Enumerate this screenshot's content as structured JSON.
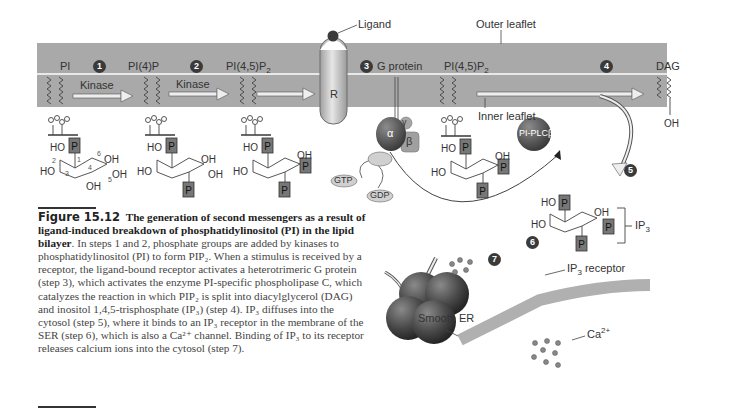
{
  "diagram": {
    "membrane": {
      "outer_leaflet_label": "Outer leaflet",
      "inner_leaflet_label": "Inner leaflet",
      "color": "#a9a9a9"
    },
    "ligand_label": "Ligand",
    "receptor_label": "R",
    "lipids": [
      {
        "label": "PI"
      },
      {
        "label": "PI(4)P"
      },
      {
        "label": "PI(4,5)P",
        "sub": "2"
      },
      {
        "label": "PI(4,5)P",
        "sub": "2"
      },
      {
        "label": "DAG"
      }
    ],
    "steps": [
      "1",
      "2",
      "3",
      "4",
      "5",
      "6",
      "7"
    ],
    "arrows": {
      "kinase_1": "Kinase",
      "kinase_2": "Kinase"
    },
    "g_protein": {
      "label": "G protein",
      "alpha": "α",
      "beta": "β",
      "gamma": "γ",
      "gtp": "GTP",
      "gdp": "GDP"
    },
    "enzyme_label": "PI-PLCβ",
    "ip3_label": "IP",
    "ip3_sub": "3",
    "ip3_receptor_label": "IP",
    "ip3_receptor_sub": "3",
    "ip3_receptor_suffix": " receptor",
    "smooth_er_label": "Smooth ER",
    "calcium_label": "Ca",
    "calcium_sup": "2+",
    "ring_labels": {
      "ho": "HO",
      "oh": "OH",
      "p": "P",
      "numbers": [
        "1",
        "2",
        "3",
        "4",
        "5",
        "6"
      ]
    },
    "dag_oh": "OH"
  },
  "caption": {
    "figure_number": "Figure 15.12",
    "title": "The generation of second messengers as a result of ligand-induced breakdown of phosphatidylinositol (PI) in the lipid bilayer",
    "body": ". In steps 1 and 2, phosphate groups are added by kinases to phosphatidylinositol (PI) to form PIP₂. When a stimulus is received by a receptor, the ligand-bound receptor activates a heterotrimeric G protein (step 3), which activates the enzyme PI-specific phospholipase C, which catalyzes the reaction in which PIP₂ is split into diacylglycerol (DAG) and inositol 1,4,5-trisphosphate (IP₃) (step 4). IP₃ diffuses into the cytosol (step 5), where it binds to an IP₃ receptor in the membrane of the SER (step 6), which is also a Ca²⁺ channel. Binding of IP₃ to its receptor releases calcium ions into the cytosol (step 7)."
  }
}
